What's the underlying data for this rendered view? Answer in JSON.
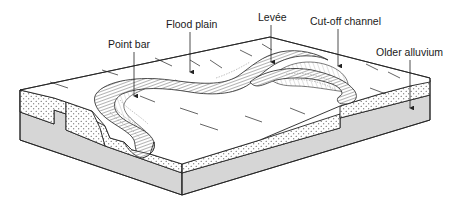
{
  "diagram": {
    "labels": [
      {
        "id": "point-bar",
        "text": "Point bar",
        "x": 108,
        "y": 45
      },
      {
        "id": "flood-plain",
        "text": "Flood plain",
        "x": 168,
        "y": 25
      },
      {
        "id": "levee",
        "text": "Levée",
        "x": 258,
        "y": 18
      },
      {
        "id": "cut-off-channel",
        "text": "Cut-off channel",
        "x": 310,
        "y": 22
      },
      {
        "id": "older-alluvium",
        "text": "Older alluvium",
        "x": 376,
        "y": 53
      }
    ],
    "components": [
      "floodplain surface",
      "meandering river channel with levées",
      "point bar deposits",
      "oxbow / cut-off channel",
      "sandy alluvial fill (stippled)",
      "older alluvium (grey base layer)"
    ],
    "colors": {
      "line": "#222222",
      "older_alluvium": "#d6d6d6",
      "surface": "#ffffff",
      "sand_dots": "#333333"
    }
  }
}
